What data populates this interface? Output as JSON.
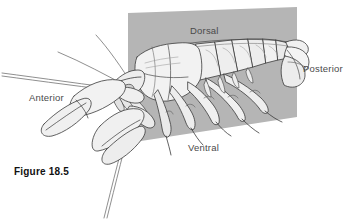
{
  "figure": {
    "caption": "Figure 18.5",
    "background_color": "#ffffff",
    "plane": {
      "name": "sagittal-reference-plane",
      "fill_color": "#b5b5b5",
      "shape": "parallelogram"
    },
    "organism": {
      "name": "crayfish",
      "body_fill": "#f2f2f2",
      "outline_color": "#3a3a3a",
      "shaded_fill": "#d8d8d8"
    }
  },
  "labels": {
    "dorsal": "Dorsal",
    "posterior": "Posterior",
    "anterior": "Anterior",
    "ventral": "Ventral",
    "text_color": "#4a4a4a"
  }
}
